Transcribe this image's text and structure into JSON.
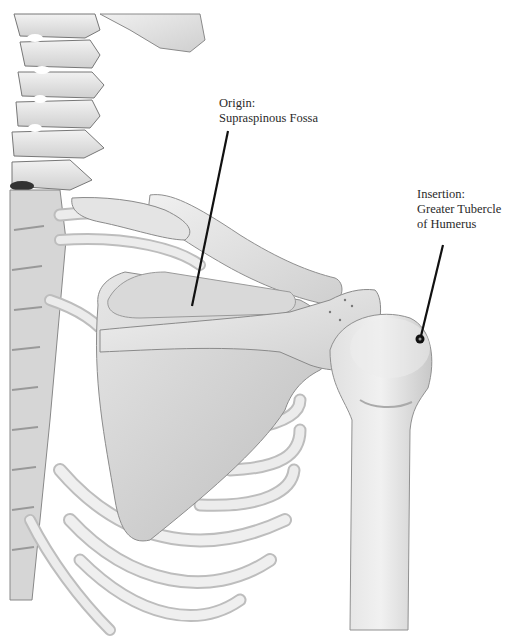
{
  "diagram": {
    "background_color": "#ffffff",
    "bone_color": "#e2e2e2",
    "shadow_color": "#9a9a9a",
    "leader_color": "#111111",
    "labels": [
      {
        "id": "origin",
        "title": "Origin:",
        "lines": [
          "Supraspinous Fossa"
        ]
      },
      {
        "id": "insertion",
        "title": "Insertion:",
        "lines": [
          "Greater Tubercle",
          "of Humerus"
        ]
      }
    ],
    "structures": [
      "cervical-vertebrae",
      "thoracic-spine",
      "ribs",
      "clavicle",
      "scapula",
      "spine-of-scapula",
      "acromion",
      "humerus-head",
      "humerus-shaft"
    ]
  }
}
